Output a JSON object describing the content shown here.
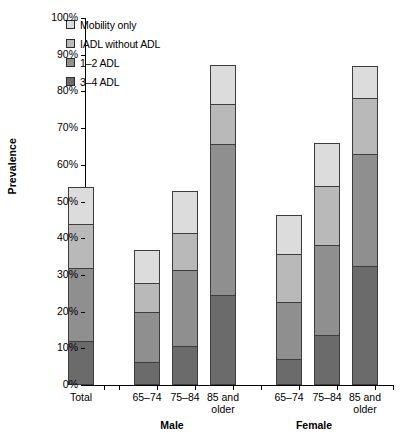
{
  "chart_data": {
    "type": "bar",
    "title": "",
    "xlabel": "",
    "ylabel": "Prevalence",
    "ylim": [
      0,
      100
    ],
    "stacked": true,
    "grid": false,
    "legend_position": "top-left",
    "ytick_labels": [
      "0%",
      "10%",
      "20%",
      "30%",
      "40%",
      "50%",
      "60%",
      "70%",
      "80%",
      "90%",
      "100%"
    ],
    "ytick_values": [
      0,
      10,
      20,
      30,
      40,
      50,
      60,
      70,
      80,
      90,
      100
    ],
    "categories": [
      "Total",
      "65–74",
      "75–84",
      "85 and\nolder",
      "65–74",
      "75–84",
      "85 and\nolder"
    ],
    "groups": [
      {
        "label": "",
        "categories": [
          "Total"
        ]
      },
      {
        "label": "Male",
        "categories": [
          "65–74",
          "75–84",
          "85 and\nolder"
        ]
      },
      {
        "label": "Female",
        "categories": [
          "65–74",
          "75–84",
          "85 and\nolder"
        ]
      }
    ],
    "series": [
      {
        "name": "3–4 ADL",
        "color": "#6b6b6b",
        "values": [
          12.1,
          6.2,
          10.5,
          24.5,
          7.2,
          13.7,
          32.5
        ]
      },
      {
        "name": "1–2 ADL",
        "color": "#8f8f8f",
        "values": [
          19.8,
          13.8,
          20.8,
          41.3,
          15.4,
          24.5,
          30.4
        ]
      },
      {
        "name": "IADL without ADL",
        "color": "#b9b9b9",
        "values": [
          12.0,
          7.7,
          10.2,
          10.7,
          13.1,
          16.0,
          15.4
        ]
      },
      {
        "name": "Mobility only",
        "color": "#dcdcdc",
        "values": [
          10.0,
          9.0,
          11.3,
          10.7,
          10.7,
          11.7,
          8.5
        ]
      }
    ],
    "cumulative_tops": [
      53.9,
      36.7,
      52.8,
      87.2,
      46.4,
      65.9,
      86.8
    ]
  },
  "legend": {
    "items": [
      {
        "label": "Mobility only",
        "color": "#dcdcdc"
      },
      {
        "label": "IADL without ADL",
        "color": "#b9b9b9"
      },
      {
        "label": "1–2 ADL",
        "color": "#8f8f8f"
      },
      {
        "label": "3–4 ADL",
        "color": "#6b6b6b"
      }
    ]
  },
  "axes": {
    "y_title": "Prevalence"
  }
}
